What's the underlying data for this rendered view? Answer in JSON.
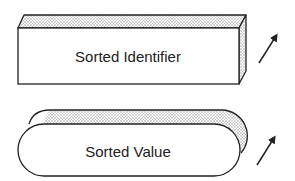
{
  "diagram": {
    "shapes": [
      {
        "type": "3d-box",
        "label": "Sorted Identifier",
        "arrow": "up-right-arrow"
      },
      {
        "type": "3d-pill",
        "label": "Sorted Value",
        "arrow": "up-right-arrow"
      }
    ]
  },
  "colors": {
    "stroke": "#222222",
    "face": "#ffffff",
    "shade": "#d9d9d9"
  }
}
